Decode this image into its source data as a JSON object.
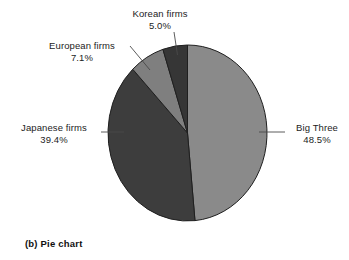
{
  "figure": {
    "caption": "(b) Pie chart",
    "background_color": "#ffffff",
    "text_color": "#1c1c1c"
  },
  "chart_data": {
    "type": "pie",
    "title": "",
    "subtitle": "",
    "xlabel": "",
    "ylabel": "",
    "grid": false,
    "legend_position": "none",
    "label_style": "external labels with leader lines",
    "start_angle_deg": 0,
    "direction": "clockwise",
    "total_percent": 100.0,
    "categories": [
      "Big Three",
      "Japanese firms",
      "European firms",
      "Korean firms"
    ],
    "values": [
      48.5,
      39.4,
      7.1,
      5.0
    ],
    "value_suffix": "%",
    "slices": [
      {
        "name": "Big Three",
        "value": 48.5,
        "value_label": "48.5%",
        "color": "#8a8a8a",
        "start_deg": 0,
        "end_deg": 174.6,
        "label_side": "right"
      },
      {
        "name": "Japanese firms",
        "value": 39.4,
        "value_label": "39.4%",
        "color": "#3d3d3d",
        "start_deg": 174.6,
        "end_deg": 316.4,
        "label_side": "left"
      },
      {
        "name": "European firms",
        "value": 7.1,
        "value_label": "7.1%",
        "color": "#7f7f7f",
        "start_deg": 316.4,
        "end_deg": 342.0,
        "label_side": "upper-left"
      },
      {
        "name": "Korean firms",
        "value": 5.0,
        "value_label": "5.0%",
        "color": "#363636",
        "start_deg": 342.0,
        "end_deg": 360.0,
        "label_side": "top"
      }
    ]
  }
}
